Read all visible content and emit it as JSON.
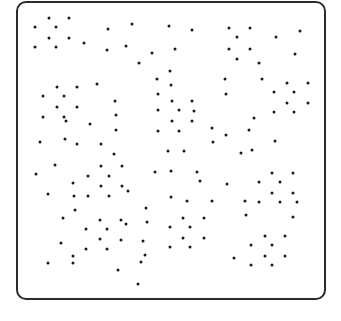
{
  "frame": {
    "border_color": "#2b2b2b",
    "dot_color": "#1a1a1a",
    "dot_radius": 1.5
  },
  "chart_data": {
    "type": "scatter",
    "title": "",
    "xlabel": "",
    "ylabel": "",
    "grid": false,
    "legend": null,
    "points": [
      [
        35,
        27
      ],
      [
        49,
        18
      ],
      [
        69,
        18
      ],
      [
        56,
        27
      ],
      [
        49,
        38
      ],
      [
        69,
        38
      ],
      [
        35,
        47
      ],
      [
        56,
        47
      ],
      [
        84,
        43
      ],
      [
        108,
        29
      ],
      [
        107,
        50
      ],
      [
        132,
        24
      ],
      [
        169,
        26
      ],
      [
        192,
        30
      ],
      [
        126,
        46
      ],
      [
        152,
        53
      ],
      [
        175,
        49
      ],
      [
        139,
        63
      ],
      [
        170,
        71
      ],
      [
        157,
        79
      ],
      [
        229,
        28
      ],
      [
        250,
        28
      ],
      [
        237,
        37
      ],
      [
        229,
        49
      ],
      [
        250,
        49
      ],
      [
        237,
        59
      ],
      [
        259,
        63
      ],
      [
        276,
        37
      ],
      [
        300,
        31
      ],
      [
        295,
        54
      ],
      [
        225,
        79
      ],
      [
        262,
        79
      ],
      [
        57,
        87
      ],
      [
        77,
        87
      ],
      [
        97,
        84
      ],
      [
        43,
        96
      ],
      [
        64,
        96
      ],
      [
        57,
        107
      ],
      [
        77,
        107
      ],
      [
        43,
        117
      ],
      [
        64,
        117
      ],
      [
        66,
        121
      ],
      [
        90,
        124
      ],
      [
        115,
        101
      ],
      [
        116,
        115
      ],
      [
        116,
        130
      ],
      [
        40,
        142
      ],
      [
        65,
        139
      ],
      [
        77,
        144
      ],
      [
        101,
        144
      ],
      [
        114,
        154
      ],
      [
        171,
        85
      ],
      [
        158,
        94
      ],
      [
        172,
        101
      ],
      [
        192,
        101
      ],
      [
        158,
        110
      ],
      [
        179,
        110
      ],
      [
        194,
        111
      ],
      [
        172,
        121
      ],
      [
        192,
        121
      ],
      [
        158,
        131
      ],
      [
        179,
        131
      ],
      [
        212,
        128
      ],
      [
        213,
        142
      ],
      [
        226,
        135
      ],
      [
        168,
        151
      ],
      [
        184,
        151
      ],
      [
        226,
        94
      ],
      [
        287,
        83
      ],
      [
        308,
        83
      ],
      [
        274,
        92
      ],
      [
        294,
        92
      ],
      [
        287,
        103
      ],
      [
        308,
        103
      ],
      [
        274,
        112
      ],
      [
        294,
        112
      ],
      [
        254,
        118
      ],
      [
        249,
        130
      ],
      [
        275,
        141
      ],
      [
        252,
        150
      ],
      [
        241,
        153
      ],
      [
        55,
        165
      ],
      [
        101,
        166
      ],
      [
        36,
        174
      ],
      [
        88,
        176
      ],
      [
        109,
        176
      ],
      [
        73,
        183
      ],
      [
        101,
        186
      ],
      [
        48,
        194
      ],
      [
        74,
        196
      ],
      [
        88,
        196
      ],
      [
        109,
        196
      ],
      [
        75,
        210
      ],
      [
        63,
        218
      ],
      [
        100,
        220
      ],
      [
        86,
        229
      ],
      [
        107,
        229
      ],
      [
        100,
        239
      ],
      [
        122,
        166
      ],
      [
        155,
        172
      ],
      [
        171,
        171
      ],
      [
        197,
        172
      ],
      [
        200,
        181
      ],
      [
        122,
        186
      ],
      [
        128,
        191
      ],
      [
        171,
        197
      ],
      [
        187,
        201
      ],
      [
        212,
        201
      ],
      [
        146,
        208
      ],
      [
        121,
        220
      ],
      [
        126,
        224
      ],
      [
        147,
        222
      ],
      [
        183,
        218
      ],
      [
        204,
        218
      ],
      [
        170,
        227
      ],
      [
        190,
        227
      ],
      [
        183,
        238
      ],
      [
        204,
        238
      ],
      [
        227,
        184
      ],
      [
        272,
        173
      ],
      [
        293,
        173
      ],
      [
        259,
        182
      ],
      [
        280,
        182
      ],
      [
        272,
        193
      ],
      [
        293,
        193
      ],
      [
        245,
        201
      ],
      [
        259,
        202
      ],
      [
        280,
        202
      ],
      [
        297,
        202
      ],
      [
        246,
        215
      ],
      [
        293,
        217
      ],
      [
        265,
        236
      ],
      [
        285,
        236
      ],
      [
        61,
        243
      ],
      [
        86,
        249
      ],
      [
        107,
        249
      ],
      [
        73,
        256
      ],
      [
        48,
        263
      ],
      [
        73,
        263
      ],
      [
        118,
        270
      ],
      [
        121,
        240
      ],
      [
        143,
        241
      ],
      [
        170,
        247
      ],
      [
        190,
        247
      ],
      [
        145,
        255
      ],
      [
        141,
        262
      ],
      [
        138,
        284
      ],
      [
        251,
        245
      ],
      [
        272,
        245
      ],
      [
        234,
        258
      ],
      [
        265,
        256
      ],
      [
        285,
        256
      ],
      [
        251,
        265
      ],
      [
        272,
        265
      ]
    ]
  }
}
